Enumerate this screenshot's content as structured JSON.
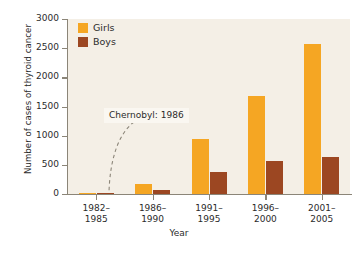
{
  "chart_data": {
    "type": "bar",
    "title": "",
    "xlabel": "Year",
    "ylabel": "Number of cases of thyroid cancer",
    "categories": [
      "1982–\n1985",
      "1986–\n1990",
      "1991–\n1995",
      "1996–\n2000",
      "2001–\n2005"
    ],
    "categories_lines": [
      [
        "1982–",
        "1985"
      ],
      [
        "1986–",
        "1990"
      ],
      [
        "1991–",
        "1995"
      ],
      [
        "1996–",
        "2000"
      ],
      [
        "2001–",
        "2005"
      ]
    ],
    "series": [
      {
        "name": "Girls",
        "color": "#f5a623",
        "values": [
          20,
          165,
          940,
          1680,
          2570
        ]
      },
      {
        "name": "Boys",
        "color": "#9c4722",
        "values": [
          10,
          70,
          375,
          565,
          630
        ]
      }
    ],
    "ylim": [
      0,
      3000
    ],
    "yticks": [
      0,
      500,
      1000,
      1500,
      2000,
      2500,
      3000
    ],
    "ytick_labels": [
      "0",
      "500",
      "1000",
      "1500",
      "2000",
      "2500",
      "3000"
    ],
    "grid": false,
    "legend_position": "top-left",
    "plot_background": "#f4efe6",
    "annotations": [
      {
        "text": "Chernobyl: 1986",
        "target_category": "1986–1990"
      }
    ]
  },
  "legend": {
    "entries": [
      {
        "label": "Girls",
        "color": "#f5a623"
      },
      {
        "label": "Boys",
        "color": "#9c4722"
      }
    ]
  }
}
